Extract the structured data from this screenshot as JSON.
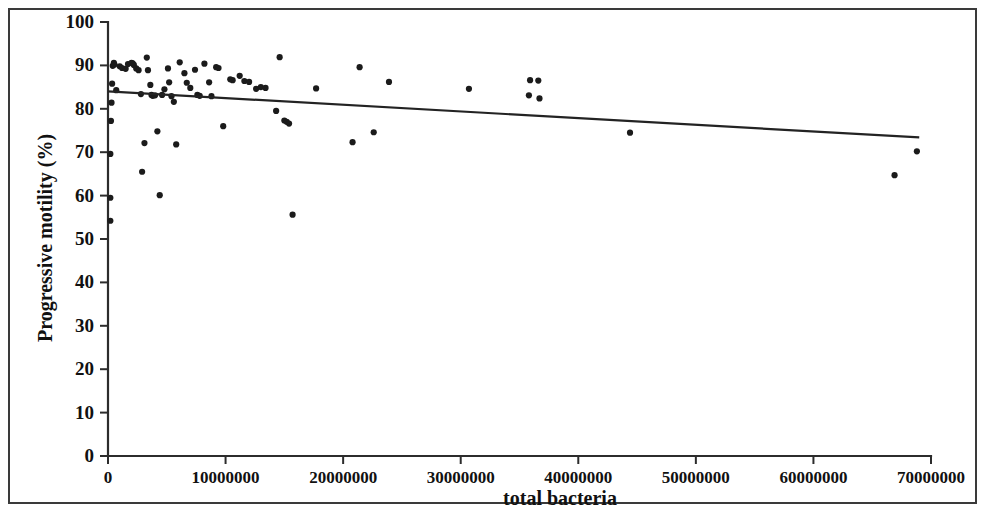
{
  "chart_data": {
    "type": "scatter",
    "title": "",
    "xlabel": "total bacteria",
    "ylabel": "Progressive motility (%)",
    "xlim": [
      0,
      70000000
    ],
    "ylim": [
      0,
      100
    ],
    "xticks": [
      0,
      10000000,
      20000000,
      30000000,
      40000000,
      50000000,
      60000000,
      70000000
    ],
    "xtick_labels": [
      "0",
      "10000000",
      "20000000",
      "30000000",
      "40000000",
      "50000000",
      "60000000",
      "70000000"
    ],
    "yticks": [
      0,
      10,
      20,
      30,
      40,
      50,
      60,
      70,
      80,
      90,
      100
    ],
    "ytick_labels": [
      "0",
      "10",
      "20",
      "30",
      "40",
      "50",
      "60",
      "70",
      "80",
      "90",
      "100"
    ],
    "grid": false,
    "legend": false,
    "marker_color": "#1b1b1b",
    "marker_size": 3.1,
    "trendline": {
      "type": "linear",
      "color": "#232323",
      "x_start": 0,
      "y_start": 84.0,
      "x_end": 69000000,
      "y_end": 73.4
    },
    "points": [
      [
        200000,
        54.2
      ],
      [
        200000,
        59.5
      ],
      [
        200000,
        69.6
      ],
      [
        250000,
        77.2
      ],
      [
        300000,
        81.4
      ],
      [
        350000,
        85.8
      ],
      [
        400000,
        89.9
      ],
      [
        500000,
        90.6
      ],
      [
        550000,
        90.2
      ],
      [
        700000,
        84.3
      ],
      [
        1000000,
        89.8
      ],
      [
        1200000,
        89.4
      ],
      [
        1500000,
        89.2
      ],
      [
        1700000,
        90.3
      ],
      [
        2000000,
        90.6
      ],
      [
        2100000,
        90.5
      ],
      [
        2200000,
        90.1
      ],
      [
        2400000,
        89.3
      ],
      [
        2600000,
        88.9
      ],
      [
        2800000,
        83.4
      ],
      [
        2900000,
        65.5
      ],
      [
        3100000,
        72.1
      ],
      [
        3300000,
        91.8
      ],
      [
        3400000,
        88.9
      ],
      [
        3600000,
        85.5
      ],
      [
        3700000,
        83.2
      ],
      [
        3800000,
        83.0
      ],
      [
        4000000,
        83.1
      ],
      [
        4200000,
        74.8
      ],
      [
        4400000,
        60.1
      ],
      [
        4600000,
        83.2
      ],
      [
        4800000,
        84.5
      ],
      [
        5100000,
        89.3
      ],
      [
        5200000,
        86.1
      ],
      [
        5400000,
        82.9
      ],
      [
        5600000,
        81.6
      ],
      [
        5800000,
        71.8
      ],
      [
        6100000,
        90.7
      ],
      [
        6500000,
        88.2
      ],
      [
        6700000,
        86.0
      ],
      [
        7000000,
        84.8
      ],
      [
        7400000,
        89.0
      ],
      [
        7600000,
        83.2
      ],
      [
        7800000,
        83.0
      ],
      [
        8200000,
        90.4
      ],
      [
        8600000,
        86.1
      ],
      [
        8800000,
        82.9
      ],
      [
        9200000,
        89.6
      ],
      [
        9400000,
        89.4
      ],
      [
        9800000,
        76.0
      ],
      [
        10400000,
        86.8
      ],
      [
        10600000,
        86.6
      ],
      [
        11200000,
        87.6
      ],
      [
        11600000,
        86.4
      ],
      [
        12000000,
        86.2
      ],
      [
        12600000,
        84.6
      ],
      [
        13000000,
        85.0
      ],
      [
        13400000,
        84.8
      ],
      [
        14300000,
        79.5
      ],
      [
        14600000,
        91.9
      ],
      [
        15000000,
        77.3
      ],
      [
        15200000,
        77.0
      ],
      [
        15400000,
        76.6
      ],
      [
        15700000,
        55.6
      ],
      [
        17700000,
        84.7
      ],
      [
        20800000,
        72.3
      ],
      [
        21400000,
        89.6
      ],
      [
        22600000,
        74.6
      ],
      [
        23900000,
        86.2
      ],
      [
        30700000,
        84.6
      ],
      [
        35900000,
        86.6
      ],
      [
        36600000,
        86.5
      ],
      [
        35800000,
        83.1
      ],
      [
        36700000,
        82.4
      ],
      [
        44400000,
        74.5
      ],
      [
        66900000,
        64.7
      ],
      [
        68800000,
        70.2
      ]
    ]
  },
  "axes": {
    "x_axis_name": "total-bacteria-axis",
    "y_axis_name": "progressive-motility-axis"
  }
}
